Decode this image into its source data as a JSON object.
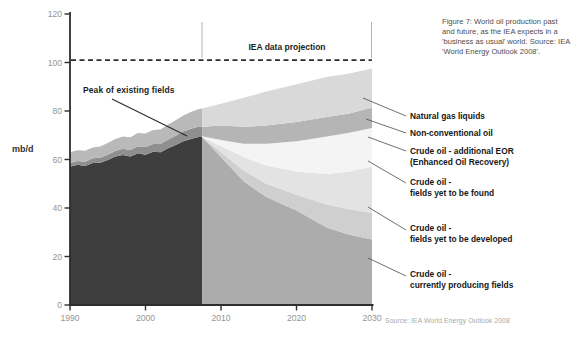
{
  "figure_caption": "Figure 7: World oil production past and future, as the IEA expects in a 'business as usual' world. Source: IEA 'World Energy Outlook 2008'.",
  "source_note": "Source: IEA World Energy Outlook 2008",
  "annotations": {
    "projection_bracket_label": "IEA data projection",
    "peak_label": "Peak of existing fields"
  },
  "y_axis": {
    "unit_label": "mb/d",
    "ticks": [
      0,
      20,
      40,
      60,
      80,
      100,
      120
    ],
    "min": 0,
    "max": 120
  },
  "x_axis": {
    "ticks": [
      1990,
      2000,
      2010,
      2020,
      2030
    ],
    "min": 1990,
    "max": 2030
  },
  "legend": [
    {
      "lines": [
        "Natural gas liquids"
      ]
    },
    {
      "lines": [
        "Non-conventional oil"
      ]
    },
    {
      "lines": [
        "Crude oil - additional EOR",
        "(Enhanced Oil Recovery)"
      ]
    },
    {
      "lines": [
        "Crude oil -",
        "fields yet to be found"
      ]
    },
    {
      "lines": [
        "Crude oil -",
        "fields yet to be developed"
      ]
    },
    {
      "lines": [
        "Crude oil -",
        "currently producing fields"
      ]
    }
  ],
  "chart_data": {
    "type": "area",
    "stacked": true,
    "unit": "mb/d",
    "xlim": [
      1990,
      2030
    ],
    "ylim": [
      0,
      120
    ],
    "grid": false,
    "dashed_reference_level": 101,
    "projection_start_year": 2007.5,
    "history": {
      "note": "values are cumulative stack tops in mb/d; layers bottom-to-top",
      "years": [
        1990,
        1991,
        1992,
        1993,
        1994,
        1995,
        1996,
        1997,
        1998,
        1999,
        2000,
        2001,
        2002,
        2003,
        2004,
        2005,
        2006,
        2007,
        2007.5
      ],
      "series": [
        {
          "name": "Crude oil - existing/currently producing fields",
          "color": "#3e3e3e",
          "cumulative_top": [
            57,
            57.8,
            57.3,
            58.6,
            58.7,
            59.8,
            61.2,
            61.9,
            61.2,
            62.6,
            62,
            63.2,
            63,
            64.6,
            66,
            67.5,
            68.5,
            69.3,
            69.3
          ]
        },
        {
          "name": "Non-conventional oil",
          "color": "#8f8f8f",
          "cumulative_top": [
            58.5,
            59.4,
            59.1,
            60.5,
            60.7,
            62,
            63.5,
            64.4,
            63.9,
            65.5,
            65.1,
            66.4,
            66.4,
            68.2,
            69.8,
            71.5,
            72.7,
            73.5,
            73.5
          ]
        },
        {
          "name": "Natural gas liquids",
          "color": "#b9b9b9",
          "cumulative_top": [
            63,
            63.8,
            63.6,
            65,
            65.3,
            66.8,
            68.4,
            69.5,
            69.2,
            70.9,
            70.7,
            72.2,
            72.4,
            74.4,
            76.2,
            78.2,
            79.6,
            80.7,
            81
          ]
        }
      ]
    },
    "projection": {
      "note": "values are cumulative stack tops in mb/d; layers bottom-to-top",
      "years": [
        2007.5,
        2010,
        2013,
        2016,
        2020,
        2024,
        2027,
        2030
      ],
      "series": [
        {
          "name": "Crude oil - currently producing fields",
          "color": "#acacac",
          "cumulative_top": [
            69.3,
            61,
            51,
            44.5,
            39,
            32,
            29,
            27
          ]
        },
        {
          "name": "Crude oil - fields yet to be developed",
          "color": "#cfcfcf",
          "cumulative_top": [
            69.3,
            63,
            55.5,
            50,
            45.5,
            41.5,
            39.5,
            38
          ]
        },
        {
          "name": "Crude oil - fields yet to be found",
          "color": "#e3e3e3",
          "cumulative_top": [
            69.3,
            65.5,
            61,
            57.5,
            55,
            54,
            55,
            57
          ]
        },
        {
          "name": "Crude oil - additional EOR (Enhanced Oil Recovery)",
          "color": "#f4f4f4",
          "cumulative_top": [
            69.6,
            68,
            66.5,
            66.5,
            67.5,
            69.5,
            71,
            73
          ]
        },
        {
          "name": "Non-conventional oil",
          "color": "#b5b5b5",
          "cumulative_top": [
            73.5,
            74,
            73.5,
            74,
            75.5,
            77.5,
            79,
            81.5
          ]
        },
        {
          "name": "Natural gas liquids",
          "color": "#d9d9d9",
          "cumulative_top": [
            81,
            83,
            85.5,
            88,
            91,
            94,
            95.5,
            97.5
          ]
        }
      ]
    },
    "colors": {
      "axis": "#2e2e2e",
      "tick_label": "#949494",
      "dashed_line": "#2e2e2e",
      "bracket_line": "#b3b3b3",
      "leader_line": "#4a4a4a"
    }
  }
}
